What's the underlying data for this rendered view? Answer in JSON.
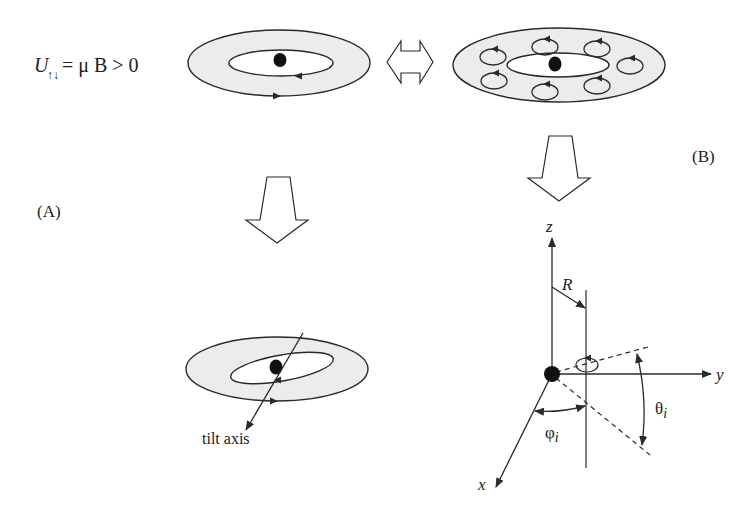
{
  "diagram": {
    "formula": {
      "symbol": "U",
      "subscript": "↑↓",
      "rhs": "= μ B > 0"
    },
    "panel_labels": {
      "a": "(A)",
      "b": "(B)"
    },
    "tilt_axis_label": "tilt axis",
    "axes": {
      "x": "x",
      "y": "y",
      "z": "z"
    },
    "radius_label": "R",
    "angle_labels": {
      "phi": "φ",
      "phi_sub": "i",
      "theta": "θ",
      "theta_sub": "i"
    },
    "colors": {
      "ring_fill": "#ececec",
      "stroke": "#2a2a2a",
      "dot": "#111111",
      "background": "#ffffff"
    },
    "elements": {
      "top_left_orbit": {
        "cx": 279,
        "cy": 63,
        "outer_rx": 91,
        "outer_ry": 33,
        "inner_rx": 52,
        "inner_ry": 13
      },
      "top_right_vortex_ring": {
        "cx": 559,
        "cy": 65,
        "outer_rx": 106,
        "outer_ry": 37,
        "inner_rx": 51,
        "inner_ry": 12,
        "vortex_count": 8
      },
      "bottom_left_tilted_orbit": {
        "cx": 277,
        "cy": 369,
        "outer_rx": 91,
        "outer_ry": 32,
        "inner_rx": 52,
        "inner_ry": 13,
        "inner_tilt_deg": -10
      }
    }
  }
}
